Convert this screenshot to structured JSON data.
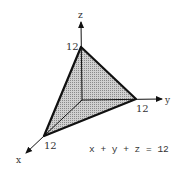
{
  "diagram": {
    "equation": "x + y + z = 12",
    "axes": {
      "x": {
        "label": "x",
        "intercept_label": "12"
      },
      "y": {
        "label": "y",
        "intercept_label": "12"
      },
      "z": {
        "label": "z",
        "intercept_label": "12"
      }
    },
    "colors": {
      "stroke": "#111111",
      "fill": "#b8b8b8",
      "text": "#333333"
    }
  }
}
